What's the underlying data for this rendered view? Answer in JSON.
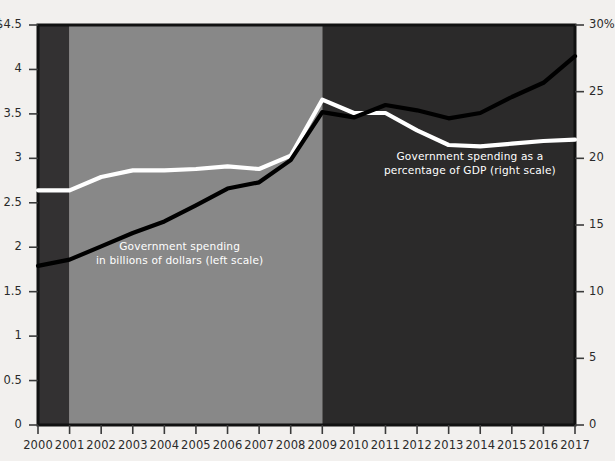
{
  "figure": {
    "background_color": "#f2f0ee",
    "plot_dark_band_color": "#333132",
    "plot_mid_band_color": "#888888",
    "plot_darker_band_color": "#2b2a2a",
    "axis_color": "#111111",
    "tick_text_color": "#2a2a2a"
  },
  "annotations": {
    "left_series": {
      "line1": "Government spending",
      "line2": "in billions of dollars (left scale)",
      "color": "#ffffff"
    },
    "right_series": {
      "line1": "Government spending as a",
      "line2": "percentage of GDP (right scale)",
      "color": "#ffffff"
    }
  },
  "axes": {
    "left": {
      "ticks": [
        "$4.5",
        "4",
        "3.5",
        "3",
        "2.5",
        "2",
        "1.5",
        "1",
        "0.5",
        "0"
      ],
      "values": [
        4.5,
        4,
        3.5,
        3,
        2.5,
        2,
        1.5,
        1,
        0.5,
        0
      ],
      "min": 0,
      "max": 4.5
    },
    "right": {
      "ticks": [
        "30%",
        "25",
        "20",
        "15",
        "10",
        "5",
        "0"
      ],
      "values": [
        30,
        25,
        20,
        15,
        10,
        5,
        0
      ],
      "min": 0,
      "max": 30
    },
    "bottom": {
      "ticks": [
        "2000",
        "2001",
        "2002",
        "2003",
        "2004",
        "2005",
        "2006",
        "2007",
        "2008",
        "2009",
        "2010",
        "2011",
        "2012",
        "2013",
        "2014",
        "2015",
        "2016",
        "2017"
      ]
    }
  },
  "chart_data": {
    "type": "line",
    "title": "",
    "subtitle": "",
    "xlabel": "",
    "ylabel": "",
    "x": [
      2000,
      2001,
      2002,
      2003,
      2004,
      2005,
      2006,
      2007,
      2008,
      2009,
      2010,
      2011,
      2012,
      2013,
      2014,
      2015,
      2016,
      2017
    ],
    "series": [
      {
        "name": "Government spending in billions of dollars (left scale)",
        "axis": "left",
        "color": "#000000",
        "ylim": [
          0,
          4.5
        ],
        "ylabel": "Trillions of dollars",
        "values": [
          1.79,
          1.86,
          2.01,
          2.16,
          2.29,
          2.47,
          2.66,
          2.73,
          2.98,
          3.52,
          3.46,
          3.6,
          3.54,
          3.45,
          3.51,
          3.69,
          3.85,
          4.15
        ]
      },
      {
        "name": "Government spending as a percentage of GDP (right scale)",
        "axis": "right",
        "color": "#ffffff",
        "ylim": [
          0,
          30
        ],
        "ylabel": "Percent of GDP",
        "values": [
          17.6,
          17.6,
          18.6,
          19.1,
          19.1,
          19.2,
          19.4,
          19.2,
          20.2,
          24.4,
          23.4,
          23.4,
          22.1,
          21.0,
          20.9,
          21.1,
          21.3,
          21.4
        ]
      }
    ],
    "bands": [
      {
        "name": "band-2000-2001",
        "from": 2000,
        "to": 2001,
        "color": "#333132"
      },
      {
        "name": "band-2001-2009",
        "from": 2001,
        "to": 2009,
        "color": "#888888"
      },
      {
        "name": "band-2009-2017",
        "from": 2009,
        "to": 2017,
        "color": "#2b2a2a"
      }
    ],
    "grid": false,
    "legend": "inline-annotations"
  }
}
